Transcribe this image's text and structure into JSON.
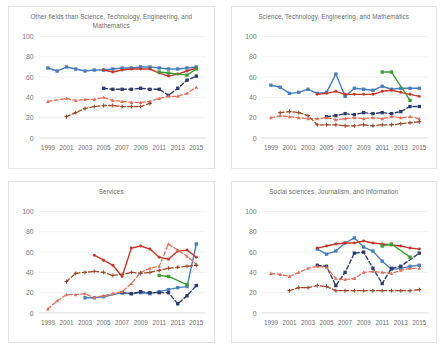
{
  "figure": {
    "layout": "2x2 grid of line charts",
    "background": "#ffffff",
    "panel_border_color": "#e3e3e3",
    "gridline_color": "#e8e8e8"
  },
  "axes": {
    "ylim": [
      0,
      100
    ],
    "yticks": [
      0,
      20,
      40,
      60,
      80,
      100
    ],
    "ytick_labels": [
      "0",
      "20",
      "40",
      "60",
      "80",
      "100"
    ],
    "xlim": [
      1998,
      2016
    ],
    "xticks": [
      1999,
      2001,
      2003,
      2005,
      2007,
      2009,
      2011,
      2013,
      2015
    ],
    "xtick_labels": [
      "1999",
      "2001",
      "2003",
      "2005",
      "2007",
      "2009",
      "2011",
      "2013",
      "2015"
    ],
    "grid": "horizontal",
    "legend": "none"
  },
  "series_style": [
    {
      "name": "series-blue",
      "color": "#4a7ebb",
      "dash": "none",
      "marker": "square",
      "width": 1.4
    },
    {
      "name": "series-red",
      "color": "#c0392b",
      "dash": "none",
      "marker": "circle",
      "width": 1.4
    },
    {
      "name": "series-navy",
      "color": "#2f3b6e",
      "dash": "dash",
      "marker": "square",
      "width": 1.4
    },
    {
      "name": "series-orange",
      "color": "#e06murky",
      "dash": "dash",
      "marker": "triangle",
      "width": 1.3
    },
    {
      "name": "series-brown",
      "color": "#9c4a2a",
      "dash": "dash",
      "marker": "plus",
      "width": 1.3
    },
    {
      "name": "series-green",
      "color": "#3f9c35",
      "dash": "none",
      "marker": "square",
      "width": 1.4
    }
  ],
  "chart_data": [
    {
      "id": "other-fields",
      "type": "line",
      "title": "Other fields than Science, Technology, Engineering, and Mathematics",
      "xlabel": "",
      "ylabel": "",
      "ylim": [
        0,
        100
      ],
      "xlim": [
        1998,
        2016
      ],
      "grid": true,
      "categories": [
        1999,
        2001,
        2003,
        2005,
        2007,
        2009,
        2011,
        2013,
        2015
      ],
      "series": [
        {
          "name": "series-blue",
          "color": "#4a7ebb",
          "x": [
            1999,
            2000,
            2001,
            2002,
            2003,
            2004,
            2005,
            2006,
            2007,
            2008,
            2009,
            2010,
            2011,
            2012,
            2013,
            2014,
            2015
          ],
          "values": [
            69,
            66,
            70,
            68,
            66,
            67,
            67,
            68,
            69,
            69,
            70,
            70,
            69,
            68,
            68,
            69,
            70
          ]
        },
        {
          "name": "series-red",
          "color": "#c0392b",
          "x": [
            2005,
            2006,
            2007,
            2008,
            2009,
            2010,
            2011,
            2012,
            2013,
            2014,
            2015
          ],
          "values": [
            67,
            65,
            67,
            68,
            68,
            68,
            64,
            61,
            63,
            66,
            69
          ]
        },
        {
          "name": "series-navy",
          "color": "#2f3b6e",
          "x": [
            2005,
            2006,
            2007,
            2008,
            2009,
            2010,
            2011,
            2012,
            2013,
            2014,
            2015
          ],
          "values": [
            49,
            48,
            48,
            48,
            49,
            48,
            48,
            42,
            49,
            57,
            61
          ]
        },
        {
          "name": "series-orange",
          "color": "#e2705a",
          "x": [
            1999,
            2001,
            2002,
            2003,
            2004,
            2005,
            2006,
            2007,
            2008,
            2009,
            2010,
            2011,
            2012,
            2013,
            2014,
            2015
          ],
          "values": [
            36,
            39,
            37,
            38,
            38,
            40,
            37,
            36,
            35,
            35,
            36,
            39,
            41,
            41,
            44,
            50
          ]
        },
        {
          "name": "series-brown",
          "color": "#9c4a2a",
          "x": [
            2001,
            2002,
            2003,
            2004,
            2005,
            2006,
            2007,
            2008,
            2009,
            2010
          ],
          "values": [
            21,
            25,
            29,
            31,
            32,
            32,
            31,
            31,
            31,
            34
          ]
        },
        {
          "name": "series-green",
          "color": "#3f9c35",
          "x": [
            2011,
            2012,
            2014,
            2015
          ],
          "values": [
            65,
            64,
            62,
            68
          ]
        }
      ]
    },
    {
      "id": "stem",
      "type": "line",
      "title": "Science, Technology, Engineering, and Mathematics",
      "xlabel": "",
      "ylabel": "",
      "ylim": [
        0,
        100
      ],
      "xlim": [
        1998,
        2016
      ],
      "grid": true,
      "categories": [
        1999,
        2001,
        2003,
        2005,
        2007,
        2009,
        2011,
        2013,
        2015
      ],
      "series": [
        {
          "name": "series-blue",
          "color": "#4a7ebb",
          "x": [
            1999,
            2000,
            2001,
            2002,
            2003,
            2004,
            2005,
            2006,
            2007,
            2008,
            2009,
            2010,
            2011,
            2012,
            2013,
            2014,
            2015
          ],
          "values": [
            52,
            50,
            44,
            45,
            48,
            44,
            45,
            63,
            41,
            49,
            48,
            47,
            51,
            48,
            49,
            49,
            49
          ]
        },
        {
          "name": "series-red",
          "color": "#c0392b",
          "x": [
            2004,
            2005,
            2006,
            2007,
            2008,
            2009,
            2010,
            2011,
            2012,
            2013,
            2014,
            2015
          ],
          "values": [
            43,
            44,
            46,
            43,
            43,
            43,
            43,
            46,
            47,
            45,
            43,
            41
          ]
        },
        {
          "name": "series-navy",
          "color": "#2f3b6e",
          "x": [
            2005,
            2006,
            2007,
            2008,
            2009,
            2010,
            2011,
            2012,
            2013,
            2014,
            2015
          ],
          "values": [
            21,
            22,
            24,
            23,
            25,
            24,
            25,
            24,
            26,
            31,
            31
          ]
        },
        {
          "name": "series-orange",
          "color": "#e2705a",
          "x": [
            1999,
            2000,
            2001,
            2002,
            2003,
            2004,
            2005,
            2006,
            2007,
            2008,
            2009,
            2010,
            2011,
            2012,
            2013,
            2014,
            2015
          ],
          "values": [
            20,
            22,
            21,
            20,
            19,
            19,
            20,
            18,
            19,
            20,
            19,
            20,
            19,
            21,
            20,
            21,
            19
          ]
        },
        {
          "name": "series-brown",
          "color": "#9c4a2a",
          "x": [
            2000,
            2001,
            2002,
            2003,
            2004,
            2005,
            2006,
            2007,
            2008,
            2009,
            2010,
            2011,
            2012,
            2013,
            2014,
            2015
          ],
          "values": [
            25,
            26,
            25,
            22,
            13,
            13,
            13,
            12,
            12,
            13,
            12,
            13,
            13,
            14,
            15,
            16
          ]
        },
        {
          "name": "series-green",
          "color": "#3f9c35",
          "x": [
            2011,
            2012,
            2014
          ],
          "values": [
            65,
            65,
            37
          ]
        }
      ]
    },
    {
      "id": "services",
      "type": "line",
      "title": "Services",
      "xlabel": "",
      "ylabel": "",
      "ylim": [
        0,
        100
      ],
      "xlim": [
        1998,
        2016
      ],
      "grid": true,
      "categories": [
        1999,
        2001,
        2003,
        2005,
        2007,
        2009,
        2011,
        2013,
        2015
      ],
      "series": [
        {
          "name": "series-blue",
          "color": "#4a7ebb",
          "x": [
            2003,
            2004,
            2005,
            2007,
            2008,
            2009,
            2010,
            2011,
            2012,
            2013,
            2014,
            2015
          ],
          "values": [
            15,
            15,
            16,
            20,
            19,
            20,
            19,
            21,
            23,
            25,
            26,
            68
          ]
        },
        {
          "name": "series-red",
          "color": "#c0392b",
          "x": [
            2004,
            2005,
            2006,
            2007,
            2008,
            2009,
            2010,
            2011,
            2012,
            2013,
            2014,
            2015
          ],
          "values": [
            57,
            52,
            47,
            36,
            64,
            66,
            63,
            55,
            53,
            61,
            62,
            55
          ]
        },
        {
          "name": "series-navy",
          "color": "#2f3b6e",
          "x": [
            2007,
            2008,
            2009,
            2010,
            2011,
            2012,
            2013,
            2014,
            2015
          ],
          "values": [
            20,
            19,
            21,
            20,
            20,
            20,
            9,
            17,
            27
          ]
        },
        {
          "name": "series-orange",
          "color": "#e2705a",
          "x": [
            1999,
            2000,
            2001,
            2002,
            2003,
            2004,
            2005,
            2006,
            2007,
            2008,
            2009,
            2010,
            2011,
            2012,
            2013,
            2014,
            2015
          ],
          "values": [
            4,
            12,
            18,
            18,
            19,
            15,
            17,
            19,
            21,
            29,
            40,
            44,
            46,
            68,
            62,
            56,
            48
          ]
        },
        {
          "name": "series-brown",
          "color": "#9c4a2a",
          "x": [
            2001,
            2002,
            2003,
            2004,
            2005,
            2006,
            2007,
            2008,
            2009,
            2010,
            2011,
            2012,
            2013,
            2014,
            2015
          ],
          "values": [
            31,
            39,
            40,
            41,
            40,
            37,
            38,
            40,
            39,
            40,
            42,
            44,
            45,
            46,
            47
          ]
        },
        {
          "name": "series-green",
          "color": "#3f9c35",
          "x": [
            2011,
            2012,
            2014
          ],
          "values": [
            37,
            36,
            28
          ]
        }
      ]
    },
    {
      "id": "social-sciences",
      "type": "line",
      "title": "Social sciences, Journalism, and Information",
      "xlabel": "",
      "ylabel": "",
      "ylim": [
        0,
        100
      ],
      "xlim": [
        1998,
        2016
      ],
      "grid": true,
      "categories": [
        1999,
        2001,
        2003,
        2005,
        2007,
        2009,
        2011,
        2013,
        2015
      ],
      "series": [
        {
          "name": "series-blue",
          "color": "#4a7ebb",
          "x": [
            2004,
            2005,
            2006,
            2007,
            2008,
            2009,
            2010,
            2011,
            2012,
            2013,
            2014,
            2015
          ],
          "values": [
            63,
            58,
            61,
            69,
            74,
            65,
            61,
            51,
            43,
            44,
            46,
            47
          ]
        },
        {
          "name": "series-red",
          "color": "#c0392b",
          "x": [
            2004,
            2005,
            2006,
            2007,
            2008,
            2009,
            2010,
            2011,
            2012,
            2013,
            2014,
            2015
          ],
          "values": [
            64,
            66,
            68,
            69,
            69,
            71,
            69,
            68,
            67,
            66,
            64,
            63
          ]
        },
        {
          "name": "series-navy",
          "color": "#2f3b6e",
          "x": [
            2004,
            2005,
            2006,
            2007,
            2008,
            2009,
            2010,
            2011,
            2012,
            2013,
            2015
          ],
          "values": [
            47,
            46,
            27,
            40,
            59,
            60,
            44,
            29,
            44,
            46,
            59
          ]
        },
        {
          "name": "series-orange",
          "color": "#e2705a",
          "x": [
            1999,
            2000,
            2001,
            2002,
            2003,
            2004,
            2005,
            2006,
            2007,
            2008,
            2009,
            2010,
            2011,
            2012,
            2013,
            2014,
            2015
          ],
          "values": [
            39,
            38,
            36,
            40,
            44,
            46,
            45,
            34,
            33,
            34,
            40,
            41,
            40,
            39,
            42,
            44,
            44
          ]
        },
        {
          "name": "series-brown",
          "color": "#9c4a2a",
          "x": [
            2001,
            2002,
            2003,
            2004,
            2005,
            2006,
            2007,
            2008,
            2009,
            2010,
            2011,
            2012,
            2013,
            2014,
            2015
          ],
          "values": [
            22,
            25,
            25,
            27,
            26,
            22,
            22,
            22,
            22,
            22,
            22,
            22,
            22,
            22,
            23
          ]
        },
        {
          "name": "series-green",
          "color": "#3f9c35",
          "x": [
            2011,
            2012,
            2014
          ],
          "values": [
            66,
            68,
            55
          ]
        }
      ]
    }
  ]
}
